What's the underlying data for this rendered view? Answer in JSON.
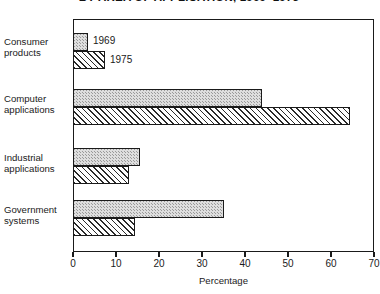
{
  "chart_data": {
    "type": "bar",
    "orientation": "horizontal",
    "title": "BY AREA OF APPLICATION, 1969–1975",
    "xlabel": "Percentage",
    "ylabel": "",
    "xlim": [
      0,
      70
    ],
    "xticks": [
      0,
      10,
      20,
      30,
      40,
      50,
      60,
      70
    ],
    "xtick_labels": [
      "0",
      "10",
      "20",
      "30",
      "40",
      "50",
      "60",
      "70"
    ],
    "grid": false,
    "legend_position": "inside-top-left",
    "categories": [
      "Consumer products",
      "Computer applications",
      "Industrial applications",
      "Government systems"
    ],
    "series": [
      {
        "name": "1969",
        "values": [
          3.5,
          44,
          15.5,
          35
        ]
      },
      {
        "name": "1975",
        "values": [
          7.5,
          64.5,
          13,
          14.5
        ]
      }
    ]
  },
  "legend": {
    "entries": [
      {
        "label": "1969",
        "pattern": "stipple"
      },
      {
        "label": "1975",
        "pattern": "diagonal-hatch"
      }
    ]
  },
  "axis": {
    "x_title": "Percentage"
  },
  "colors": {
    "axis": "#1a1a1a",
    "bar_1969_fill": "#dedede",
    "bar_1975_fill": "#ffffff",
    "background": "#ffffff"
  }
}
